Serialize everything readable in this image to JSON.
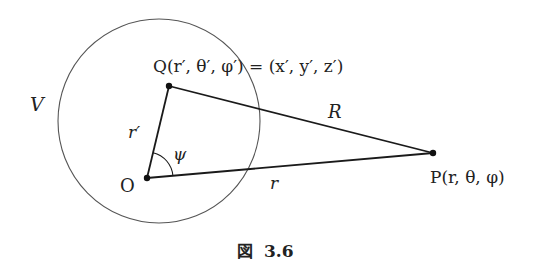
{
  "figure": {
    "caption_prefix": "図",
    "caption_number": "3.6",
    "region_label": "V",
    "points": {
      "O": {
        "label": "O"
      },
      "Q": {
        "label": "Q(r′, θ′, φ′) = (x′, y′, z′)"
      },
      "P": {
        "label": "P(r, θ, φ)"
      }
    },
    "segments": {
      "OQ": {
        "label": "r′"
      },
      "QP": {
        "label": "R"
      },
      "OP": {
        "label": "r"
      }
    },
    "angle": {
      "label": "ψ",
      "between": [
        "OQ",
        "OP"
      ]
    },
    "colors": {
      "line": "#1a1a1a",
      "circle": "#555555",
      "text": "#222222"
    }
  }
}
